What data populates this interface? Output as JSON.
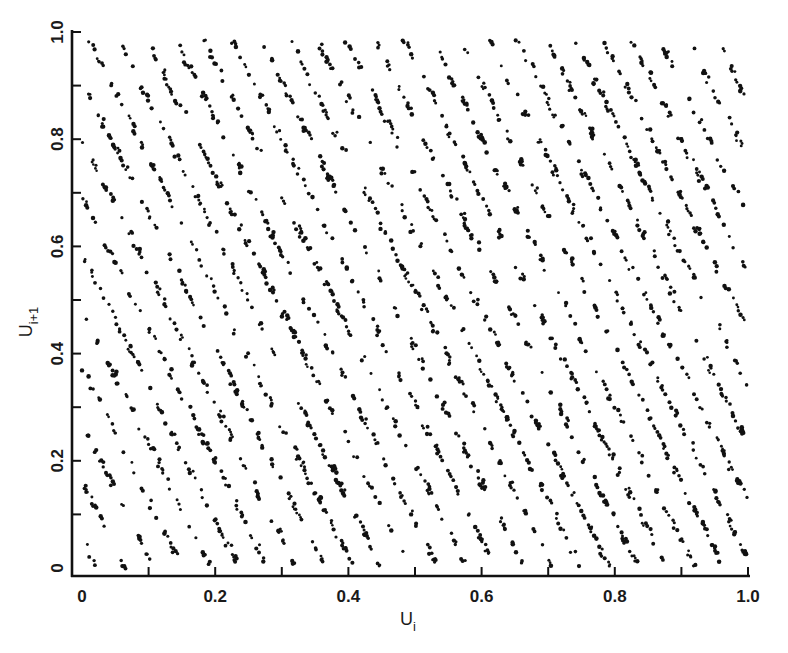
{
  "chart_data": {
    "type": "scatter",
    "title": "",
    "xlabel": "U_i",
    "xlabel_main": "U",
    "xlabel_sub": "i",
    "ylabel": "U_{i+1}",
    "ylabel_main": "U",
    "ylabel_sub": "i+1",
    "xlim": [
      0,
      1.0
    ],
    "ylim": [
      0,
      1.0
    ],
    "grid": false,
    "legend": null,
    "x_tick_labels": [
      "0",
      "0.2",
      "0.4",
      "0.6",
      "0.8",
      "1.0"
    ],
    "x_tick_values": [
      0,
      0.2,
      0.4,
      0.6,
      0.8,
      1.0
    ],
    "x_minor_ticks": [
      0.1,
      0.3,
      0.5,
      0.7,
      0.9
    ],
    "y_tick_labels": [
      "0",
      "0.2",
      "0.4",
      "0.6",
      "0.8",
      "1.0"
    ],
    "y_tick_values": [
      0,
      0.2,
      0.4,
      0.6,
      0.8,
      1.0
    ],
    "y_minor_ticks": [
      0.1,
      0.3,
      0.5,
      0.7,
      0.9
    ],
    "lattice": {
      "line_count_across_x": 23.4,
      "horizontal_spacing": 0.0428,
      "slope": -2.49,
      "vertical_spacing": 0.1065,
      "phase": 0.006,
      "points_per_line_unit": 95,
      "jitter": 0.0035,
      "seed": 12345
    },
    "series": [
      {
        "name": "pairs (U_i, U_i+1)",
        "marker": "dot",
        "color": "#111111"
      }
    ]
  },
  "colors": {
    "background": "#ffffff",
    "ink": "#111111"
  }
}
